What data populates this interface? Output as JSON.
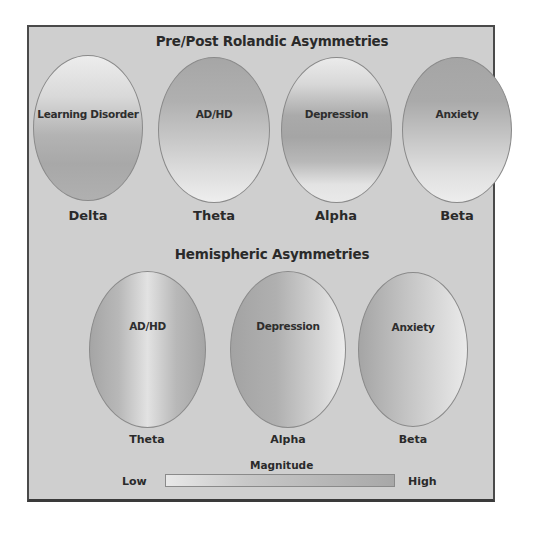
{
  "sections": {
    "top_title": "Pre/Post Rolandic Asymmetries",
    "bottom_title": "Hemispheric Asymmetries"
  },
  "top_row": [
    {
      "condition": "Learning Disorder",
      "band": "Delta",
      "gradient": "vertical: light top, dark bottom"
    },
    {
      "condition": "AD/HD",
      "band": "Theta",
      "gradient": "vertical: dark top, light bottom"
    },
    {
      "condition": "Depression",
      "band": "Alpha",
      "gradient": "vertical: dark middle band"
    },
    {
      "condition": "Anxiety",
      "band": "Beta",
      "gradient": "vertical: dark top, light bottom"
    }
  ],
  "bottom_row": [
    {
      "condition": "AD/HD",
      "band": "Theta",
      "gradient": "horizontal: dark sides, light center"
    },
    {
      "condition": "Depression",
      "band": "Alpha",
      "gradient": "horizontal: dark left, light right"
    },
    {
      "condition": "Anxiety",
      "band": "Beta",
      "gradient": "horizontal: dark left, light right"
    }
  ],
  "legend": {
    "title": "Magnitude",
    "low_label": "Low",
    "high_label": "High",
    "low_color": "#e8e8e8",
    "high_color": "#a8a8a8"
  },
  "colors": {
    "panel_bg": "#cfcfcf",
    "border": "#4a4a4a",
    "text": "#2a2a2a"
  }
}
